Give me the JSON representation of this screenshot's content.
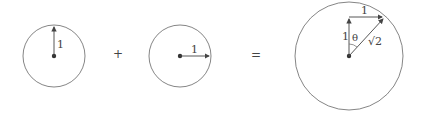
{
  "diagram": {
    "circle_a": {
      "radius_label": "1",
      "direction": "up"
    },
    "operator_plus": "+",
    "circle_b": {
      "radius_label": "1",
      "direction": "right"
    },
    "operator_equals": "=",
    "circle_result": {
      "vertical_label": "1",
      "horizontal_label": "1",
      "angle_label": "θ",
      "hypotenuse_label": "√2"
    },
    "colors": {
      "stroke": "#555555",
      "text": "#444444"
    }
  }
}
